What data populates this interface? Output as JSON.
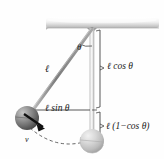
{
  "figure": {
    "type": "physics-diagram",
    "background_color": "#fefefe"
  },
  "ceiling": {
    "name": "ceiling-slab",
    "color_top": "#fbfbfb",
    "color_bottom": "#bcbcbc",
    "x": 45,
    "y": 17,
    "width": 115,
    "height": 11
  },
  "pivot": {
    "x": 92,
    "y": 28,
    "label": ""
  },
  "string": {
    "name": "pendulum-string",
    "color": "#8f8f8f",
    "from_x": 92,
    "from_y": 28,
    "to_x": 27,
    "to_y": 118,
    "label": "ℓ"
  },
  "vertical": {
    "name": "vertical-reference-line",
    "color": "#b5b5b5",
    "from_x": 92,
    "from_y": 28,
    "to_x": 92,
    "to_y": 141
  },
  "angle": {
    "name": "theta-angle",
    "label": "θ",
    "arc_radius": 17
  },
  "bob_displaced": {
    "name": "pendulum-bob-displaced",
    "cx": 27,
    "cy": 118,
    "r": 12,
    "color_light": "#b9b9b9",
    "color_dark": "#4e4e4e"
  },
  "bob_rest": {
    "name": "pendulum-bob-rest",
    "cx": 92,
    "cy": 141,
    "r": 12,
    "color_light": "#e2e2e2",
    "color_dark": "#9a9a9a"
  },
  "velocity": {
    "name": "velocity-vector",
    "label": "v⃗",
    "label_text": "v",
    "from_x": 27,
    "from_y": 118,
    "to_x": 44,
    "to_y": 130,
    "color": "#1a1a1a"
  },
  "arc_path": {
    "name": "swing-arc-path",
    "style": "dashed",
    "color": "#555555"
  },
  "labels": {
    "length": "ℓ",
    "theta": "θ",
    "l_cos_theta": "ℓ cos θ",
    "l_sin_theta": "ℓ sin θ",
    "l_one_minus_cos_theta": "ℓ (1−cos θ)"
  },
  "measure_lines": {
    "horizontal_sin": {
      "from_x": 27,
      "from_y": 110,
      "to_x": 92,
      "to_y": 110
    },
    "bracket_cos": {
      "x": 99,
      "top_y": 30,
      "bottom_y": 108
    },
    "bracket_onecos": {
      "x": 99,
      "top_y": 112,
      "bottom_y": 140
    }
  }
}
